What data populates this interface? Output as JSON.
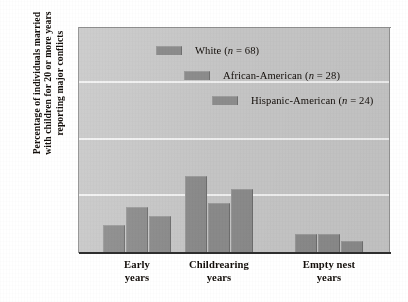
{
  "chart_data": {
    "type": "bar",
    "title": "",
    "subtitle": "",
    "xlabel": "",
    "ylabel": "Percentage of individuals married with children for 20 or more years reporting major conflicts",
    "ylabel_lines": [
      "Percentage of individuals married",
      "with children for 20 or more years",
      "reporting major conflicts"
    ],
    "categories": [
      "Early years",
      "Childrearing years",
      "Empty nest years"
    ],
    "category_lines": [
      [
        "Early",
        "years"
      ],
      [
        "Childrearing",
        "years"
      ],
      [
        "Empty nest",
        "years"
      ]
    ],
    "series": [
      {
        "name": "White (n = 68)",
        "label_main": "White",
        "label_n": "(n = 68)",
        "values": [
          12,
          34,
          8
        ]
      },
      {
        "name": "African-American (n = 28)",
        "label_main": "African-American",
        "label_n": "(n = 28)",
        "values": [
          20,
          22,
          8
        ]
      },
      {
        "name": "Hispanic-American (n = 24)",
        "label_main": "Hispanic-American",
        "label_n": "(n = 24)",
        "values": [
          16,
          28,
          5
        ]
      }
    ],
    "ylim": [
      0,
      100
    ],
    "yticks": [
      0,
      25,
      50,
      75,
      100
    ],
    "ytick_labels": [
      "0",
      "25",
      "50",
      "75",
      "100"
    ],
    "grid": true,
    "grid_color": "#f2f2f2",
    "legend_position": "top-center",
    "bar_color": "#8c8c8c",
    "plot_background": "#c8c8c8",
    "page_background": "#ffffff"
  }
}
